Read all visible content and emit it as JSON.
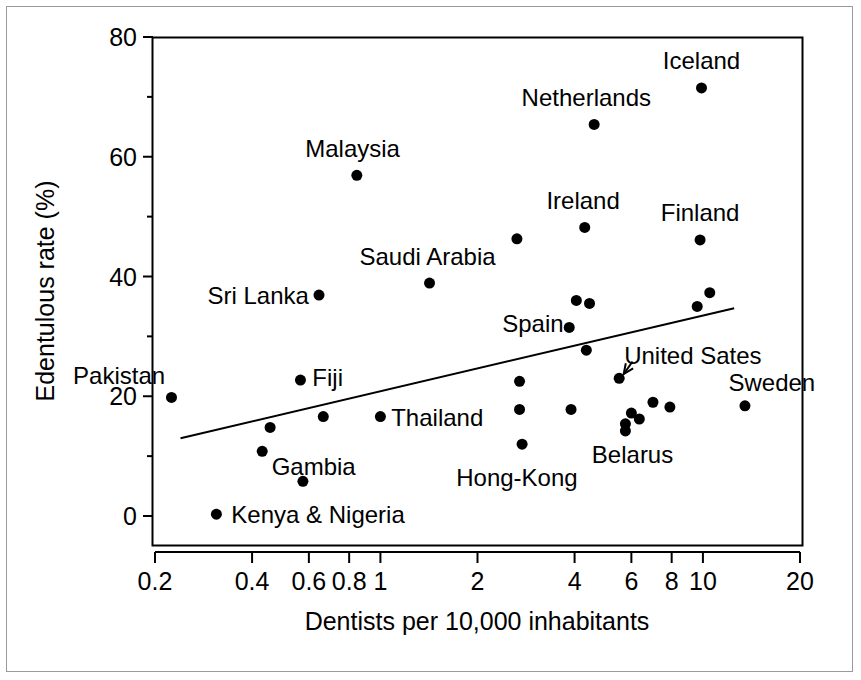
{
  "chart_data": {
    "type": "scatter",
    "title": "",
    "xlabel": "Dentists per 10,000 inhabitants",
    "ylabel": "Edentulous rate (%)",
    "xscale": "log",
    "yscale": "linear",
    "xlim": [
      0.2,
      20
    ],
    "ylim": [
      0,
      80
    ],
    "xticks": [
      "0.2",
      "0.4",
      "0.6",
      "0.8",
      "1",
      "2",
      "4",
      "6",
      "8",
      "10",
      "20"
    ],
    "xtick_values": [
      0.2,
      0.4,
      0.6,
      0.8,
      1,
      2,
      4,
      6,
      8,
      10,
      20
    ],
    "yticks": [
      "0",
      "20",
      "40",
      "60",
      "80"
    ],
    "ytick_values": [
      0,
      20,
      40,
      60,
      80
    ],
    "yminor_ticks": [
      10,
      30,
      50,
      70
    ],
    "grid": false,
    "legend": "none",
    "marker_color": "#000000",
    "line_color": "#000000",
    "points": [
      {
        "label": "Pakistan",
        "x": 0.225,
        "y": 19.8
      },
      {
        "label": "Kenya & Nigeria",
        "x": 0.31,
        "y": 0.3
      },
      {
        "label": "",
        "x": 0.43,
        "y": 10.8
      },
      {
        "label": "",
        "x": 0.455,
        "y": 14.8
      },
      {
        "label": "Gambia",
        "x": 0.575,
        "y": 5.8
      },
      {
        "label": "Fiji",
        "x": 0.565,
        "y": 22.7
      },
      {
        "label": "Sri Lanka",
        "x": 0.645,
        "y": 36.9
      },
      {
        "label": "",
        "x": 0.665,
        "y": 16.6
      },
      {
        "label": "Malaysia",
        "x": 0.845,
        "y": 56.9
      },
      {
        "label": "Thailand",
        "x": 1.0,
        "y": 16.6
      },
      {
        "label": "Saudi Arabia",
        "x": 1.42,
        "y": 38.9
      },
      {
        "label": "",
        "x": 2.65,
        "y": 46.3
      },
      {
        "label": "",
        "x": 2.7,
        "y": 22.5
      },
      {
        "label": "",
        "x": 2.7,
        "y": 17.8
      },
      {
        "label": "Hong-Kong",
        "x": 2.75,
        "y": 12.0
      },
      {
        "label": "Spain",
        "x": 3.85,
        "y": 31.5
      },
      {
        "label": "",
        "x": 3.9,
        "y": 17.8
      },
      {
        "label": "",
        "x": 4.05,
        "y": 36.0
      },
      {
        "label": "",
        "x": 4.3,
        "y": 48.2
      },
      {
        "label": "",
        "x": 4.45,
        "y": 35.5
      },
      {
        "label": "",
        "x": 4.35,
        "y": 27.7
      },
      {
        "label": "Netherlands",
        "x": 4.6,
        "y": 65.4
      },
      {
        "label": "United Sates",
        "x": 5.5,
        "y": 23.0
      },
      {
        "label": "Belarus",
        "x": 5.75,
        "y": 15.4
      },
      {
        "label": "",
        "x": 5.75,
        "y": 14.2
      },
      {
        "label": "",
        "x": 6.0,
        "y": 17.2
      },
      {
        "label": "",
        "x": 6.35,
        "y": 16.2
      },
      {
        "label": "",
        "x": 7.0,
        "y": 19.0
      },
      {
        "label": "",
        "x": 7.9,
        "y": 18.2
      },
      {
        "label": "",
        "x": 9.6,
        "y": 35.0
      },
      {
        "label": "Finland",
        "x": 9.8,
        "y": 46.1
      },
      {
        "label": "Iceland",
        "x": 9.9,
        "y": 71.5
      },
      {
        "label": "",
        "x": 10.5,
        "y": 37.3
      },
      {
        "label": "Sweden",
        "x": 13.5,
        "y": 18.4
      }
    ],
    "trend_line": {
      "description": "linear regression line on log-x axis",
      "x_start": 0.24,
      "y_start": 13.0,
      "x_end": 12.5,
      "y_end": 34.7
    },
    "annotations": [
      {
        "text": "Pakistan",
        "anchor": "end",
        "lx": 0.215,
        "ly": 23.5
      },
      {
        "text": "Fiji",
        "anchor": "start",
        "lx": 0.615,
        "ly": 23.2
      },
      {
        "text": "Gambia",
        "anchor": "start",
        "lx": 0.46,
        "ly": 8.3
      },
      {
        "text": "Kenya & Nigeria",
        "anchor": "start",
        "lx": 0.345,
        "ly": 0.3
      },
      {
        "text": "Sri Lanka",
        "anchor": "end",
        "lx": 0.6,
        "ly": 36.9
      },
      {
        "text": "Malaysia",
        "anchor": "middle",
        "lx": 0.82,
        "ly": 61.5
      },
      {
        "text": "Thailand",
        "anchor": "start",
        "lx": 1.08,
        "ly": 16.6
      },
      {
        "text": "Saudi Arabia",
        "anchor": "middle",
        "lx": 1.4,
        "ly": 43.4
      },
      {
        "text": "Hong-Kong",
        "anchor": "middle",
        "lx": 2.65,
        "ly": 6.5
      },
      {
        "text": "Spain",
        "anchor": "end",
        "lx": 3.7,
        "ly": 32.2
      },
      {
        "text": "Ireland",
        "anchor": "middle",
        "lx": 4.25,
        "ly": 52.8
      },
      {
        "text": "Netherlands",
        "anchor": "middle",
        "lx": 4.35,
        "ly": 69.9
      },
      {
        "text": "United Sates",
        "anchor": "start",
        "lx": 5.7,
        "ly": 26.9
      },
      {
        "text": "Belarus",
        "anchor": "middle",
        "lx": 6.05,
        "ly": 10.3
      },
      {
        "text": "Finland",
        "anchor": "middle",
        "lx": 9.8,
        "ly": 50.8
      },
      {
        "text": "Iceland",
        "anchor": "middle",
        "lx": 9.9,
        "ly": 76.1
      },
      {
        "text": "Sweden",
        "anchor": "start",
        "lx": 12.0,
        "ly": 22.3
      }
    ],
    "arrow": {
      "from_x": 6.05,
      "from_y": 25.8,
      "to_x": 5.68,
      "to_y": 23.7,
      "points_to": "United Sates"
    }
  }
}
